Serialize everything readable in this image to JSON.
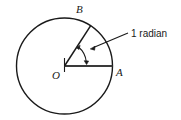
{
  "figure": {
    "type": "geometry-diagram",
    "background_color": "#ffffff",
    "stroke_color": "#1a1a1a",
    "labels": {
      "center_point": "O",
      "arc_point": "B",
      "radius_point": "A",
      "angle_callout": "1 radian"
    },
    "geometry": {
      "circle": {
        "center_x": 64.5,
        "center_y": 66,
        "radius": 48
      },
      "radius_oa": {
        "from_x": 64.5,
        "from_y": 66,
        "to_x": 112.5,
        "to_y": 66,
        "angle_degrees": 0
      },
      "radius_ob": {
        "from_x": 64.5,
        "from_y": 66,
        "to_x": 90.7,
        "to_y": 25.7,
        "angle_degrees": 57.3
      },
      "angle_arc": {
        "sweep_degrees": 57.3,
        "arrow_heads": "both",
        "arc_radius": 22
      },
      "leader_line": {
        "from_x": 128,
        "from_y": 33,
        "to_x": 90,
        "to_y": 49
      },
      "center_tick": {
        "x": 64.5,
        "top_y": 58,
        "bottom_y": 72
      }
    }
  }
}
